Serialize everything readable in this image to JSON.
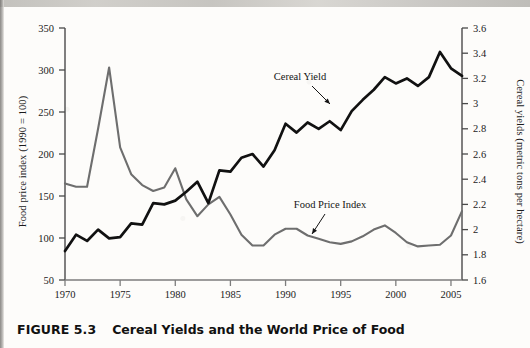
{
  "figure": {
    "caption_number": "FIGURE 5.3",
    "caption_title": "Cereal Yields and the World Price of Food"
  },
  "chart_data": {
    "type": "line",
    "title": "Cereal Yields and the World Price of Food",
    "xlabel": "",
    "ylabel": "Food price index (1990 = 100)",
    "y2label": "Cereal yields (metric tons per hectare)",
    "xlim": [
      1970,
      2006
    ],
    "ylim": [
      50,
      350
    ],
    "y2lim": [
      1.6,
      3.6
    ],
    "grid": false,
    "legend_position": "inline-annotation",
    "x_ticks": [
      1970,
      1975,
      1980,
      1985,
      1990,
      1995,
      2000,
      2005
    ],
    "y_ticks": [
      50,
      100,
      150,
      200,
      250,
      300,
      350
    ],
    "y2_ticks": [
      "1.6",
      "1.8",
      "2",
      "2.2",
      "2.4",
      "2.6",
      "2.8",
      "3",
      "3.2",
      "3.4",
      "3.6"
    ],
    "x": [
      1970,
      1971,
      1972,
      1973,
      1974,
      1975,
      1976,
      1977,
      1978,
      1979,
      1980,
      1981,
      1982,
      1983,
      1984,
      1985,
      1986,
      1987,
      1988,
      1989,
      1990,
      1991,
      1992,
      1993,
      1994,
      1995,
      1996,
      1997,
      1998,
      1999,
      2000,
      2001,
      2002,
      2003,
      2004,
      2005,
      2006
    ],
    "series": [
      {
        "name": "Food Price Index",
        "color": "#6e6e6e",
        "axis": "left",
        "unit": "index (1990 = 100)",
        "values": [
          165,
          161,
          161,
          230,
          303,
          208,
          176,
          163,
          156,
          160,
          183,
          146,
          126,
          140,
          149,
          128,
          104,
          91,
          91,
          104,
          111,
          111,
          103,
          99,
          95,
          93,
          96,
          102,
          110,
          115,
          106,
          95,
          90,
          91,
          92,
          103,
          132
        ]
      },
      {
        "name": "Cereal Yield",
        "color": "#111111",
        "axis": "right",
        "unit": "metric tons per hectare",
        "values": [
          1.83,
          1.96,
          1.91,
          2.0,
          1.93,
          1.94,
          2.05,
          2.04,
          2.21,
          2.2,
          2.23,
          2.3,
          2.38,
          2.21,
          2.47,
          2.46,
          2.57,
          2.6,
          2.5,
          2.63,
          2.84,
          2.77,
          2.85,
          2.8,
          2.86,
          2.79,
          2.94,
          3.03,
          3.11,
          3.21,
          3.16,
          3.2,
          3.14,
          3.21,
          3.41,
          3.28,
          3.22
        ]
      }
    ],
    "annotations": [
      {
        "text": "Cereal Yield",
        "x": 1991.5,
        "y_display": "upper-middle"
      },
      {
        "text": "Food Price Index",
        "x": 1993.5,
        "y_display": "lower-middle"
      }
    ]
  }
}
